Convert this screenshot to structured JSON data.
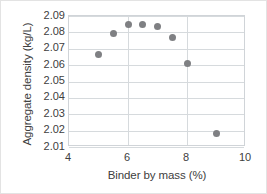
{
  "chart_data": {
    "type": "scatter",
    "title": "",
    "xlabel": "Binder by mass (%)",
    "ylabel": "Aggregate density (kg/L)",
    "xlim": [
      4,
      10
    ],
    "ylim": [
      2.01,
      2.09
    ],
    "xticks": [
      "4",
      "6",
      "8",
      "10"
    ],
    "xtick_values": [
      4,
      6,
      8,
      10
    ],
    "yticks": [
      "2.09",
      "2.08",
      "2.07",
      "2.06",
      "2.05",
      "2.04",
      "2.03",
      "2.02",
      "2.01"
    ],
    "ytick_values": [
      2.09,
      2.08,
      2.07,
      2.06,
      2.05,
      2.04,
      2.03,
      2.02,
      2.01
    ],
    "grid": true,
    "legend": false,
    "marker_color": "#7f8083",
    "gridline_color": "#d6dadd",
    "axis_text_color": "#404040",
    "series": [
      {
        "name": "Aggregate density",
        "x": [
          5.0,
          5.5,
          6.0,
          6.5,
          7.0,
          7.5,
          8.0,
          9.0
        ],
        "y": [
          2.0663,
          2.0793,
          2.0851,
          2.0851,
          2.0836,
          2.077,
          2.061,
          2.0184
        ]
      }
    ]
  }
}
